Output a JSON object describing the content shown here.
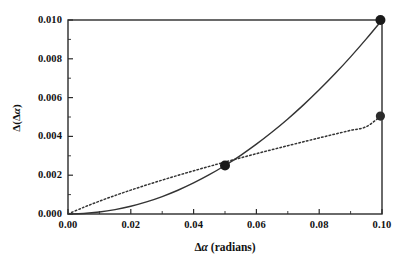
{
  "chart_data": {
    "type": "line",
    "title": "",
    "subtitle": "",
    "xlabel": "Δα (radians)",
    "ylabel": "Δ(Δα)",
    "xlim": [
      0.0,
      0.1
    ],
    "ylim": [
      0.0,
      0.01
    ],
    "grid": false,
    "legend": "none",
    "xticks": [
      "0.00",
      "0.02",
      "0.04",
      "0.06",
      "0.08",
      "0.10"
    ],
    "xtick_values": [
      0.0,
      0.02,
      0.04,
      0.06,
      0.08,
      0.1
    ],
    "yticks": [
      "0.000",
      "0.002",
      "0.004",
      "0.006",
      "0.008",
      "0.010"
    ],
    "ytick_values": [
      0.0,
      0.002,
      0.004,
      0.006,
      0.008,
      0.01
    ],
    "series": [
      {
        "name": "solid-quadratic-curve",
        "style": "solid",
        "color": "#333333",
        "x": [
          0.0,
          0.005,
          0.01,
          0.015,
          0.02,
          0.025,
          0.03,
          0.035,
          0.04,
          0.045,
          0.05,
          0.055,
          0.06,
          0.065,
          0.07,
          0.075,
          0.08,
          0.085,
          0.09,
          0.095,
          0.1
        ],
        "values": [
          0.0,
          2.5e-05,
          0.0001,
          0.000225,
          0.0004,
          0.000625,
          0.0009,
          0.001225,
          0.0016,
          0.002025,
          0.0025,
          0.003025,
          0.0036,
          0.004225,
          0.0049,
          0.005625,
          0.0064,
          0.007225,
          0.0081,
          0.009025,
          0.01
        ]
      },
      {
        "name": "dotted-sublinear-curve",
        "style": "dotted",
        "color": "#333333",
        "x": [
          0.0,
          0.005,
          0.01,
          0.015,
          0.02,
          0.025,
          0.03,
          0.035,
          0.04,
          0.045,
          0.05,
          0.055,
          0.06,
          0.065,
          0.07,
          0.075,
          0.08,
          0.085,
          0.09,
          0.095,
          0.1
        ],
        "values": [
          0.0,
          0.000345,
          0.00066,
          0.000955,
          0.001232,
          0.001495,
          0.001748,
          0.001991,
          0.002226,
          0.002455,
          0.002677,
          0.002895,
          0.003108,
          0.003317,
          0.003522,
          0.003724,
          0.003922,
          0.004118,
          0.004311,
          0.004502,
          0.0051
        ]
      }
    ],
    "markers": [
      {
        "name": "intersection-marker",
        "x": 0.05,
        "y": 0.0025,
        "radius": 5.0,
        "color": "#1a1a1a"
      },
      {
        "name": "solid-endpoint-marker",
        "x": 0.0995,
        "y": 0.01,
        "radius": 5.0,
        "color": "#1a1a1a"
      },
      {
        "name": "dotted-endpoint-marker",
        "x": 0.0995,
        "y": 0.00505,
        "radius": 4.6,
        "color": "#2b2b2b"
      }
    ],
    "frame": {
      "color": "#2b2b2b",
      "left_px": 68,
      "right_px": 382,
      "top_px": 20,
      "bottom_px": 214
    }
  }
}
